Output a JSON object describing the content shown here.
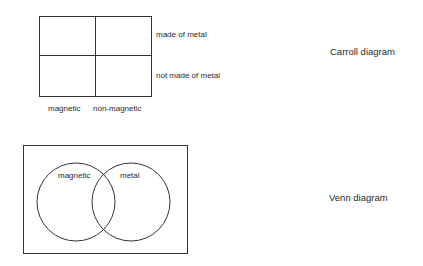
{
  "carroll": {
    "title": "Carroll diagram",
    "rows": [
      "made of metal",
      "not made of metal"
    ],
    "columns": [
      "magnetic",
      "non-magnetic"
    ],
    "grid": {
      "x": 39,
      "y": 16,
      "width": 112,
      "height": 80,
      "col_split": 95,
      "row_split": 55
    }
  },
  "venn": {
    "title": "Venn diagram",
    "sets": [
      "magnetic",
      "metal"
    ],
    "frame": {
      "x": 23,
      "y": 145,
      "width": 164,
      "height": 108
    },
    "circles": [
      {
        "label": "magnetic",
        "cx": 76,
        "cy": 202,
        "r": 39
      },
      {
        "label": "metal",
        "cx": 131,
        "cy": 202,
        "r": 39
      }
    ]
  },
  "colors": {
    "line": "#333333",
    "text": "#2a2a2a",
    "background": "#ffffff"
  }
}
